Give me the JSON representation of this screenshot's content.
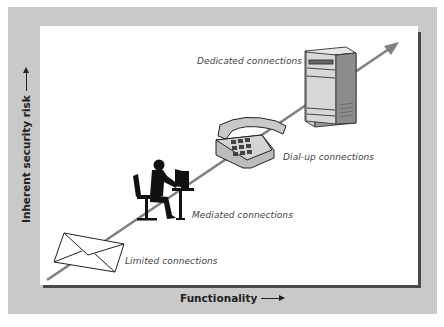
{
  "diagram": {
    "axes": {
      "y_label": "Inherent security risk",
      "x_label": "Functionality"
    },
    "trend_arrow": {
      "direction": "up-right",
      "color": "#808080"
    },
    "levels": [
      {
        "label": "Limited connections",
        "icon": "envelope-icon"
      },
      {
        "label": "Mediated connections",
        "icon": "person-at-computer-icon"
      },
      {
        "label": "Dial-up connections",
        "icon": "telephone-icon"
      },
      {
        "label": "Dedicated connections",
        "icon": "server-tower-icon"
      }
    ],
    "colors": {
      "frame": "#c9c9c9",
      "panel": "#ffffff",
      "shadow": "#4a4a4a",
      "arrow": "#808080"
    }
  }
}
